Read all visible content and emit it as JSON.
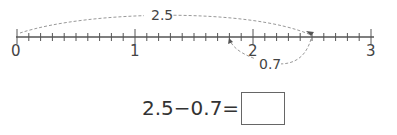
{
  "number_line": {
    "min": 0,
    "max": 3,
    "major_step": 1,
    "minor_step": 0.1,
    "tick_labels": [
      "0",
      "1",
      "2",
      "3"
    ],
    "arcs": [
      {
        "from": 0,
        "to": 2.5,
        "label": "2.5",
        "position": "above",
        "style": "dashed"
      },
      {
        "from": 2.5,
        "to": 1.8,
        "label": "0.7",
        "position": "below",
        "style": "dashed"
      }
    ]
  },
  "equation": {
    "expression": "2.5−0.7=",
    "answer": ""
  }
}
